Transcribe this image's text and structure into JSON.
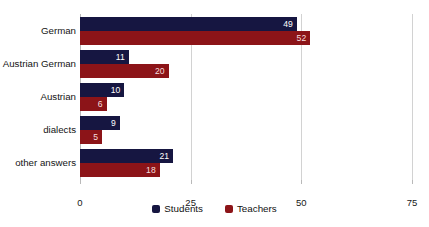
{
  "chart_data": {
    "type": "bar",
    "orientation": "horizontal",
    "title": "",
    "xlabel": "",
    "ylabel": "",
    "xlim": [
      0,
      75
    ],
    "xticks": [
      "0",
      "25",
      "50",
      "75"
    ],
    "grid": true,
    "legend_position": "bottom",
    "categories": [
      "German",
      "Austrian German",
      "Austrian",
      "dialects",
      "other answers"
    ],
    "series": [
      {
        "name": "Students",
        "color": "#161641",
        "values": [
          49,
          11,
          10,
          9,
          21
        ]
      },
      {
        "name": "Teachers",
        "color": "#8c1418",
        "values": [
          52,
          20,
          6,
          5,
          18
        ]
      }
    ]
  },
  "axis": {
    "ticks": [
      {
        "label": "0",
        "value": 0
      },
      {
        "label": "25",
        "value": 25
      },
      {
        "label": "50",
        "value": 50
      },
      {
        "label": "75",
        "value": 75
      }
    ]
  },
  "rows": [
    {
      "category": "German",
      "students": {
        "value": 49,
        "label": "49"
      },
      "teachers": {
        "value": 52,
        "label": "52"
      }
    },
    {
      "category": "Austrian German",
      "students": {
        "value": 11,
        "label": "11"
      },
      "teachers": {
        "value": 20,
        "label": "20"
      }
    },
    {
      "category": "Austrian",
      "students": {
        "value": 10,
        "label": "10"
      },
      "teachers": {
        "value": 6,
        "label": "6"
      }
    },
    {
      "category": "dialects",
      "students": {
        "value": 9,
        "label": "9"
      },
      "teachers": {
        "value": 5,
        "label": "5"
      }
    },
    {
      "category": "other answers",
      "students": {
        "value": 21,
        "label": "21"
      },
      "teachers": {
        "value": 18,
        "label": "18"
      }
    }
  ],
  "legend": {
    "items": [
      {
        "label": "Students",
        "color": "#161641"
      },
      {
        "label": "Teachers",
        "color": "#8c1418"
      }
    ]
  },
  "colors": {
    "students": "#161641",
    "teachers": "#8c1418",
    "gridline": "#d2d2d2",
    "axis": "#b9b9b9",
    "background": "#ffffff"
  }
}
